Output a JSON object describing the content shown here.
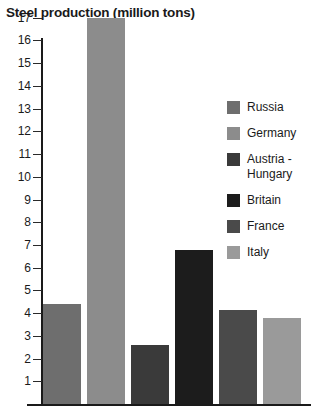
{
  "chart_data": {
    "type": "bar",
    "title": "Steel production (million tons)",
    "xlabel": "",
    "ylabel": "",
    "ylim": [
      0,
      17
    ],
    "grid": false,
    "legend_position": "right",
    "y_ticks": [
      17,
      16,
      15,
      14,
      13,
      12,
      11,
      10,
      9,
      8,
      7,
      6,
      5,
      4,
      3,
      2,
      1
    ],
    "categories": [
      "Russia",
      "Germany",
      "Austria - Hungary",
      "Britain",
      "France",
      "Italy"
    ],
    "values": [
      4.4,
      17.0,
      2.6,
      6.8,
      4.15,
      3.8
    ],
    "colors": [
      "#6e6e6e",
      "#8c8c8c",
      "#3a3a3a",
      "#1c1c1c",
      "#4a4a4a",
      "#9a9a9a"
    ]
  },
  "legend": {
    "items": [
      {
        "label": "Russia",
        "color": "#6e6e6e"
      },
      {
        "label": "Germany",
        "color": "#8c8c8c"
      },
      {
        "label": "Austria -\nHungary",
        "color": "#3a3a3a"
      },
      {
        "label": "Britain",
        "color": "#1c1c1c"
      },
      {
        "label": "France",
        "color": "#4a4a4a"
      },
      {
        "label": "Italy",
        "color": "#9a9a9a"
      }
    ]
  }
}
